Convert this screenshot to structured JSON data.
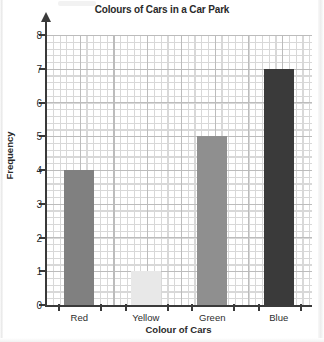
{
  "chart_data": {
    "type": "bar",
    "title": "Colours of Cars in a Car Park",
    "xlabel": "Colour of Cars",
    "ylabel": "Frequency",
    "categories": [
      "Red",
      "Yellow",
      "Green",
      "Blue"
    ],
    "values": [
      4,
      1,
      5,
      7
    ],
    "ylim": [
      0,
      8
    ],
    "yticks": [
      0,
      1,
      2,
      3,
      4,
      5,
      6,
      7,
      8
    ],
    "ytick_labels": [
      "0",
      "1",
      "2",
      "3",
      "4",
      "5",
      "6",
      "7",
      "8"
    ],
    "grid": true,
    "grid_minor": true,
    "legend": false,
    "bar_colors": [
      "#808080",
      "#e8e8e8",
      "#8f8f8f",
      "#3a3a3a"
    ],
    "axis_color": "#3a3a3a",
    "grid_major_color": "#bcbcbc",
    "grid_minor_color": "#d8d8d8",
    "text_color": "#2a2a2a",
    "background": "#ffffff"
  }
}
